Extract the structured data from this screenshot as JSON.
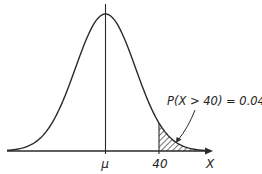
{
  "chart_data": {
    "type": "area",
    "title": "",
    "xlabel": "X",
    "ylabel": "",
    "x_ticks": [
      {
        "label": "μ",
        "position": "mean"
      },
      {
        "label": "40",
        "position": "threshold"
      }
    ],
    "shaded_region": {
      "from": 40,
      "to": "+inf",
      "pattern": "diagonal-hatch"
    },
    "annotations": [
      {
        "text": "P(X > 40) = 0.04",
        "points_to": "shaded tail"
      }
    ],
    "grid": false,
    "legend": null,
    "probability": 0.04,
    "threshold": 40
  },
  "labels": {
    "mu": "μ",
    "threshold": "40",
    "x_axis": "X",
    "annotation": "P(X > 40) = 0.04"
  },
  "colors": {
    "line": "#2a2a2a",
    "background": "#ffffff"
  }
}
